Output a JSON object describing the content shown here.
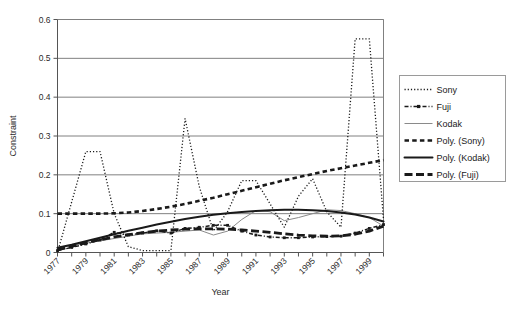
{
  "chart_data": {
    "type": "line",
    "title": "",
    "xlabel": "Year",
    "ylabel": "Constraint",
    "xlim": [
      1977,
      2000
    ],
    "ylim": [
      0,
      0.6
    ],
    "ytick_labels": [
      "0",
      "0.1",
      "0.2",
      "0.3",
      "0.4",
      "0.5",
      "0.6"
    ],
    "ytick_values": [
      0,
      0.1,
      0.2,
      0.3,
      0.4,
      0.5,
      0.6
    ],
    "xtick_labels": [
      "1977",
      "1979",
      "1981",
      "1983",
      "1985",
      "1987",
      "1989",
      "1991",
      "1993",
      "1995",
      "1997",
      "1999"
    ],
    "xtick_values": [
      1977,
      1979,
      1981,
      1983,
      1985,
      1987,
      1989,
      1991,
      1993,
      1995,
      1997,
      1999
    ],
    "minor_xtick_values": [
      1978,
      1980,
      1982,
      1984,
      1986,
      1988,
      1990,
      1992,
      1994,
      1996,
      1998,
      2000
    ],
    "grid": "horizontal",
    "legend_position": "right",
    "x": [
      1977,
      1978,
      1979,
      1980,
      1981,
      1982,
      1983,
      1984,
      1985,
      1986,
      1987,
      1988,
      1989,
      1990,
      1991,
      1992,
      1993,
      1994,
      1995,
      1996,
      1997,
      1998,
      1999,
      2000
    ],
    "series": [
      {
        "name": "Sony",
        "style": "fine-dotted",
        "color": "#1a1a1a",
        "values": [
          0.0,
          0.13,
          0.26,
          0.26,
          0.1,
          0.015,
          0.005,
          0.005,
          0.005,
          0.345,
          0.17,
          0.055,
          0.105,
          0.185,
          0.185,
          0.125,
          0.065,
          0.145,
          0.19,
          0.105,
          0.065,
          0.55,
          0.55,
          0.085
        ]
      },
      {
        "name": "Fuji",
        "style": "dash-dot-marker",
        "color": "#1a1a1a",
        "values": [
          0.005,
          0.013,
          0.022,
          0.032,
          0.052,
          0.045,
          0.05,
          0.056,
          0.05,
          0.062,
          0.065,
          0.07,
          0.07,
          0.055,
          0.045,
          0.04,
          0.038,
          0.038,
          0.04,
          0.041,
          0.042,
          0.05,
          0.062,
          0.072
        ]
      },
      {
        "name": "Kodak",
        "style": "thin-solid",
        "color": "#8a8a8a",
        "values": [
          0.012,
          0.018,
          0.024,
          0.03,
          0.036,
          0.042,
          0.048,
          0.05,
          0.052,
          0.055,
          0.058,
          0.045,
          0.055,
          0.085,
          0.108,
          0.105,
          0.082,
          0.09,
          0.1,
          0.11,
          0.108,
          0.1,
          0.09,
          0.068
        ]
      },
      {
        "name": "Poly. (Sony)",
        "style": "thick-dashed",
        "color": "#1a1a1a",
        "values": [
          0.1,
          0.1,
          0.1,
          0.1,
          0.101,
          0.103,
          0.107,
          0.112,
          0.118,
          0.125,
          0.133,
          0.141,
          0.15,
          0.159,
          0.168,
          0.177,
          0.186,
          0.194,
          0.202,
          0.21,
          0.217,
          0.224,
          0.231,
          0.238
        ]
      },
      {
        "name": "Poly. (Kodak)",
        "style": "thick-solid",
        "color": "#1a1a1a",
        "values": [
          0.012,
          0.02,
          0.029,
          0.038,
          0.047,
          0.056,
          0.064,
          0.072,
          0.079,
          0.086,
          0.092,
          0.097,
          0.101,
          0.104,
          0.107,
          0.109,
          0.11,
          0.11,
          0.109,
          0.107,
          0.103,
          0.098,
          0.09,
          0.08
        ]
      },
      {
        "name": "Poly. (Fuji)",
        "style": "thick-longdash",
        "color": "#1a1a1a",
        "values": [
          0.007,
          0.016,
          0.025,
          0.033,
          0.04,
          0.046,
          0.051,
          0.055,
          0.058,
          0.06,
          0.061,
          0.061,
          0.06,
          0.058,
          0.055,
          0.052,
          0.048,
          0.045,
          0.043,
          0.042,
          0.043,
          0.047,
          0.055,
          0.068
        ]
      }
    ]
  },
  "legend": {
    "items": [
      {
        "label": "Sony",
        "swatch": "fine-dotted"
      },
      {
        "label": "Fuji",
        "swatch": "dash-dot-marker"
      },
      {
        "label": "Kodak",
        "swatch": "thin-solid"
      },
      {
        "label": "Poly. (Sony)",
        "swatch": "thick-dashed"
      },
      {
        "label": "Poly. (Kodak)",
        "swatch": "thick-solid"
      },
      {
        "label": "Poly. (Fuji)",
        "swatch": "thick-longdash"
      }
    ]
  }
}
